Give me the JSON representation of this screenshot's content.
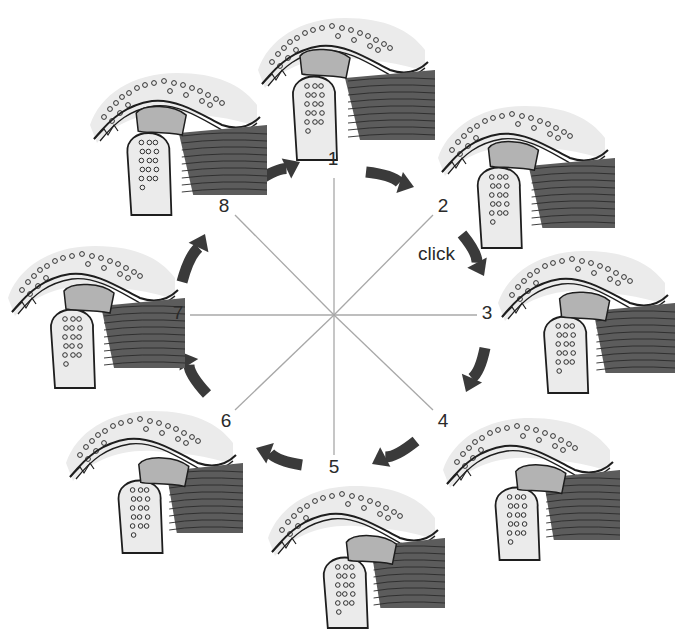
{
  "diagram": {
    "type": "cyclic-sequence",
    "center": [
      334,
      315
    ],
    "annotation": {
      "text": "click",
      "position": [
        418,
        254
      ],
      "between_phases": [
        2,
        3
      ]
    },
    "colors": {
      "background": "#ffffff",
      "bone_halo": "#ebebeb",
      "outline": "#1e1e1e",
      "disc": "#b3b3b3",
      "muscle": "#5c5c5c",
      "muscle_stripe": "#2a2a2a",
      "arrow": "#3a3a3a",
      "spoke": "#a8a8a8",
      "text": "#2a2a2a"
    },
    "phases": [
      {
        "id": 1,
        "label": "1",
        "label_pos": [
          333,
          158
        ],
        "spoke_end": [
          334,
          178
        ],
        "image_pos": [
          250,
          0
        ],
        "disc_shift": 0,
        "mouth": "closed"
      },
      {
        "id": 2,
        "label": "2",
        "label_pos": [
          443,
          205
        ],
        "spoke_end": [
          433,
          215
        ],
        "image_pos": [
          430,
          88
        ],
        "disc_shift": 6,
        "mouth": "opening"
      },
      {
        "id": 3,
        "label": "3",
        "label_pos": [
          487,
          312
        ],
        "spoke_end": [
          477,
          315
        ],
        "image_pos": [
          490,
          233
        ],
        "disc_shift": 14,
        "mouth": "opening"
      },
      {
        "id": 4,
        "label": "4",
        "label_pos": [
          443,
          420
        ],
        "spoke_end": [
          433,
          410
        ],
        "image_pos": [
          435,
          400
        ],
        "disc_shift": 22,
        "mouth": "open"
      },
      {
        "id": 5,
        "label": "5",
        "label_pos": [
          334,
          466
        ],
        "spoke_end": [
          334,
          455
        ],
        "image_pos": [
          260,
          468
        ],
        "disc_shift": 26,
        "mouth": "wide-open"
      },
      {
        "id": 6,
        "label": "6",
        "label_pos": [
          226,
          420
        ],
        "spoke_end": [
          235,
          410
        ],
        "image_pos": [
          58,
          393
        ],
        "disc_shift": 22,
        "mouth": "closing"
      },
      {
        "id": 7,
        "label": "7",
        "label_pos": [
          178,
          312
        ],
        "spoke_end": [
          190,
          315
        ],
        "image_pos": [
          0,
          228
        ],
        "disc_shift": 10,
        "mouth": "closing"
      },
      {
        "id": 8,
        "label": "8",
        "label_pos": [
          224,
          205
        ],
        "spoke_end": [
          235,
          215
        ],
        "image_pos": [
          82,
          55
        ],
        "disc_shift": 3,
        "mouth": "closed"
      }
    ],
    "arrows": [
      {
        "from": 8,
        "to": 1,
        "start": [
          252,
          185
        ],
        "end": [
          300,
          162
        ]
      },
      {
        "from": 1,
        "to": 2,
        "start": [
          366,
          172
        ],
        "end": [
          414,
          187
        ]
      },
      {
        "from": 2,
        "to": 3,
        "start": [
          462,
          234
        ],
        "end": [
          484,
          276
        ]
      },
      {
        "from": 3,
        "to": 4,
        "start": [
          485,
          348
        ],
        "end": [
          466,
          392
        ]
      },
      {
        "from": 4,
        "to": 5,
        "start": [
          416,
          441
        ],
        "end": [
          372,
          464
        ]
      },
      {
        "from": 5,
        "to": 6,
        "start": [
          302,
          465
        ],
        "end": [
          256,
          448
        ]
      },
      {
        "from": 6,
        "to": 7,
        "start": [
          207,
          394
        ],
        "end": [
          181,
          352
        ]
      },
      {
        "from": 7,
        "to": 8,
        "start": [
          182,
          282
        ],
        "end": [
          205,
          234
        ]
      }
    ]
  }
}
